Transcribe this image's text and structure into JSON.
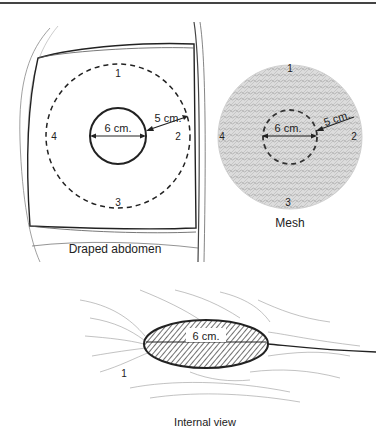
{
  "figures": {
    "draped_abdomen": {
      "caption": "Draped abdomen",
      "inner_label": "6 cm.",
      "radius_label": "5 cm.",
      "positions": [
        "1",
        "2",
        "3",
        "4"
      ]
    },
    "mesh": {
      "caption": "Mesh",
      "inner_label": "6 cm.",
      "radius_label": "5 cm.",
      "positions": [
        "1",
        "2",
        "3",
        "4"
      ]
    },
    "internal_view": {
      "caption": "Internal view",
      "inner_label": "6 cm.",
      "marker": "1"
    }
  },
  "colors": {
    "ink": "#222222",
    "mesh_fill": "#d4d4d4",
    "frame_rule": "#444444"
  }
}
